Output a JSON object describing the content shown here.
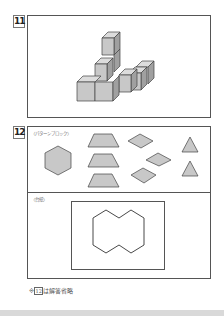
{
  "problems": [
    {
      "number": "11",
      "figure": "isometric-cube-stack",
      "cube_count_visible": 7
    },
    {
      "number": "12",
      "sections": [
        {
          "caption": "〈パターンブロック〉",
          "blocks": [
            {
              "shape": "hexagon",
              "count": 1
            },
            {
              "shape": "trapezoid",
              "count": 3
            },
            {
              "shape": "rhombus",
              "count": 3
            },
            {
              "shape": "triangle",
              "count": 2
            }
          ]
        },
        {
          "caption": "〈台紙〉",
          "figure": "outline-of-two-hexagons"
        }
      ]
    }
  ],
  "note": {
    "prefix": "※",
    "boxed": "12",
    "suffix": "は解答省略"
  },
  "colors": {
    "fill": "#c8c8c8",
    "side": "#a0a0a0",
    "stroke": "#444444"
  }
}
